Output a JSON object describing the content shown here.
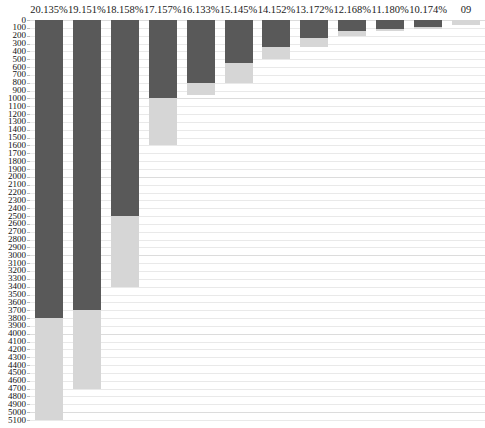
{
  "chart_data": {
    "type": "bar",
    "title": "",
    "subtitle": "",
    "xlabel": "",
    "ylabel": "",
    "stacked": true,
    "orientation": "vertical",
    "y_inverted": true,
    "ylim": [
      0,
      5100
    ],
    "y_tick_step": 100,
    "grid": true,
    "legend": "none",
    "categories": [
      "20.135%",
      "19.151%",
      "18.158%",
      "17.157%",
      "16.133%",
      "15.145%",
      "14.152%",
      "13.172%",
      "12.168%",
      "11.180%",
      "10.174%",
      "09"
    ],
    "series": [
      {
        "name": "dark",
        "color": "#595959",
        "values": [
          3800,
          3700,
          2500,
          1000,
          800,
          550,
          350,
          230,
          140,
          110,
          95,
          0
        ]
      },
      {
        "name": "light",
        "color": "#d6d6d6",
        "values": [
          1300,
          1000,
          900,
          600,
          150,
          250,
          150,
          120,
          60,
          30,
          15,
          60
        ]
      }
    ],
    "totals": [
      5100,
      4700,
      3400,
      1600,
      950,
      800,
      500,
      350,
      200,
      140,
      110,
      60
    ],
    "y_tick_labels": [
      "0",
      "100",
      "200",
      "300",
      "400",
      "500",
      "600",
      "700",
      "800",
      "900",
      "1000",
      "1100",
      "1200",
      "1300",
      "1400",
      "1500",
      "1600",
      "1700",
      "1800",
      "1900",
      "2000",
      "2100",
      "2200",
      "2300",
      "2400",
      "2500",
      "2600",
      "2700",
      "2800",
      "2900",
      "3000",
      "3100",
      "3200",
      "3300",
      "3400",
      "3500",
      "3600",
      "3700",
      "3800",
      "3900",
      "4000",
      "4100",
      "4200",
      "4300",
      "4400",
      "4500",
      "4600",
      "4700",
      "4800",
      "4900",
      "5000",
      "5100"
    ]
  },
  "colors": {
    "dark_segment": "#595959",
    "light_segment": "#d6d6d6",
    "gridline": "#e9e9e9",
    "text": "#1a1a1a",
    "background": "#ffffff"
  }
}
